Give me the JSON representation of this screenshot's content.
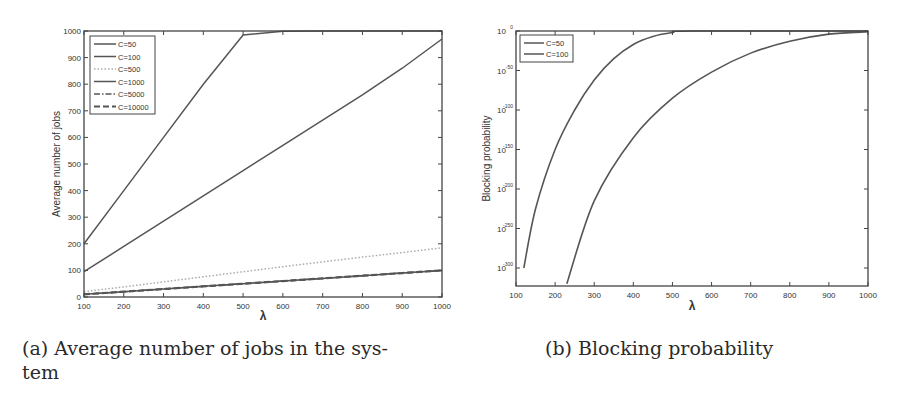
{
  "figure": {
    "captions": {
      "a": "(a) Average number of jobs in the sys-",
      "a_cont": "tem",
      "b": "(b) Blocking probability"
    }
  },
  "chart_data": [
    {
      "type": "line",
      "title": "",
      "caption": "(a) Average number of jobs in the system",
      "xlabel": "λ",
      "ylabel": "Average number of jobs",
      "xlim": [
        100,
        1000
      ],
      "ylim": [
        0,
        1000
      ],
      "xticks": [
        "100",
        "200",
        "300",
        "400",
        "500",
        "600",
        "700",
        "800",
        "900",
        "1000"
      ],
      "yticks": [
        "0",
        "100",
        "200",
        "300",
        "400",
        "500",
        "600",
        "700",
        "800",
        "900",
        "1000"
      ],
      "legend_position": "upper left",
      "grid": false,
      "x": [
        100,
        200,
        300,
        400,
        500,
        600,
        700,
        800,
        900,
        1000
      ],
      "series": [
        {
          "name": "C=50",
          "style": "solid",
          "values": [
            200,
            400,
            600,
            800,
            985,
            999,
            1000,
            1000,
            1000,
            1000
          ]
        },
        {
          "name": "C=100",
          "style": "solid",
          "values": [
            95,
            190,
            285,
            380,
            475,
            570,
            665,
            760,
            860,
            970
          ]
        },
        {
          "name": "C=500",
          "style": "dotted",
          "values": [
            20,
            38,
            57,
            76,
            95,
            114,
            132,
            150,
            167,
            185
          ]
        },
        {
          "name": "C=1000",
          "style": "solid",
          "values": [
            10,
            20,
            30,
            40,
            50,
            60,
            70,
            80,
            90,
            100
          ]
        },
        {
          "name": "C=5000",
          "style": "dash-dot",
          "values": [
            10,
            20,
            30,
            40,
            50,
            60,
            70,
            80,
            90,
            100
          ]
        },
        {
          "name": "C=10000",
          "style": "dashed",
          "values": [
            10,
            20,
            30,
            40,
            50,
            60,
            70,
            80,
            90,
            100
          ]
        }
      ]
    },
    {
      "type": "line",
      "title": "",
      "caption": "(b) Blocking probability",
      "xlabel": "λ",
      "ylabel": "Blocking probability",
      "yscale": "log",
      "xlim": [
        100,
        1000
      ],
      "ylim_exponent": [
        -320,
        0
      ],
      "xticks": [
        "100",
        "200",
        "300",
        "400",
        "500",
        "600",
        "700",
        "800",
        "900",
        "1000"
      ],
      "yticks": [
        "10^0",
        "10^-50",
        "10^-100",
        "10^-150",
        "10^-200",
        "10^-250",
        "10^-300"
      ],
      "legend_position": "upper left",
      "grid": false,
      "series": [
        {
          "name": "C=50",
          "x": [
            120,
            150,
            200,
            250,
            300,
            350,
            400,
            450,
            500,
            550,
            1000
          ],
          "log10_values": [
            -300,
            -225,
            -150,
            -100,
            -62,
            -35,
            -17,
            -7,
            -2,
            0,
            0
          ]
        },
        {
          "name": "C=100",
          "x": [
            230,
            300,
            400,
            500,
            600,
            700,
            800,
            900,
            1000
          ],
          "log10_values": [
            -320,
            -215,
            -135,
            -85,
            -52,
            -28,
            -13,
            -4,
            -1
          ]
        }
      ]
    }
  ]
}
